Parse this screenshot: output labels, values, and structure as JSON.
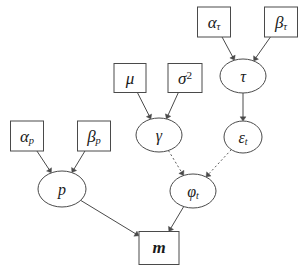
{
  "figure": {
    "type": "bayesian-network-dag",
    "background_color": "#ffffff",
    "stroke_color": "#4a4a4a",
    "text_color": "#1a1a1a",
    "width": 308,
    "height": 271,
    "top_cropped_text": "                                    "
  },
  "nodes": [
    {
      "id": "alpha_tau",
      "shape": "rect",
      "label_html": "&alpha;<sub>&tau;</sub>",
      "label_text": "alpha_tau",
      "role": "hyperparameter",
      "x": 214,
      "y": 22,
      "w": 33,
      "h": 30
    },
    {
      "id": "beta_tau",
      "shape": "rect",
      "label_html": "&beta;<sub>&tau;</sub>",
      "label_text": "beta_tau",
      "role": "hyperparameter",
      "x": 281,
      "y": 22,
      "w": 33,
      "h": 30
    },
    {
      "id": "tau",
      "shape": "ellipse",
      "label_html": "&tau;",
      "label_text": "tau",
      "role": "latent",
      "x": 243,
      "y": 76,
      "w": 46,
      "h": 34
    },
    {
      "id": "mu",
      "shape": "rect",
      "label_html": "&mu;",
      "label_text": "mu",
      "role": "hyperparameter",
      "x": 130,
      "y": 78,
      "w": 32,
      "h": 29
    },
    {
      "id": "sigma_sq",
      "shape": "rect",
      "label_html": "&sigma;<sup>2</sup>",
      "label_text": "sigma_squared",
      "role": "hyperparameter",
      "x": 185,
      "y": 78,
      "w": 34,
      "h": 29
    },
    {
      "id": "gamma",
      "shape": "ellipse",
      "label_html": "&gamma;",
      "label_text": "gamma",
      "role": "latent",
      "x": 159,
      "y": 135,
      "w": 46,
      "h": 34
    },
    {
      "id": "epsilon_t",
      "shape": "ellipse",
      "label_html": "&epsilon;<sub>t</sub>",
      "label_text": "epsilon_t",
      "role": "latent",
      "x": 243,
      "y": 137,
      "w": 38,
      "h": 32
    },
    {
      "id": "alpha_p",
      "shape": "rect",
      "label_html": "&alpha;<sub>p</sub>",
      "label_text": "alpha_p",
      "role": "hyperparameter",
      "x": 27,
      "y": 136,
      "w": 33,
      "h": 30
    },
    {
      "id": "beta_p",
      "shape": "rect",
      "label_html": "&beta;<sub>p</sub>",
      "label_text": "beta_p",
      "role": "hyperparameter",
      "x": 94,
      "y": 136,
      "w": 33,
      "h": 30
    },
    {
      "id": "p",
      "shape": "ellipse",
      "label_html": "p",
      "label_text": "p",
      "role": "latent",
      "x": 62,
      "y": 189,
      "w": 48,
      "h": 36
    },
    {
      "id": "phi_t",
      "shape": "ellipse",
      "label_html": "&phi;<sub>t</sub>",
      "label_text": "phi_t",
      "role": "latent",
      "x": 193,
      "y": 191,
      "w": 46,
      "h": 34
    },
    {
      "id": "m",
      "shape": "rect",
      "label_html": "m",
      "label_text": "m",
      "role": "observed",
      "x": 159,
      "y": 248,
      "w": 40,
      "h": 33
    }
  ],
  "edges": [
    {
      "from": "alpha_tau",
      "to": "tau",
      "style": "solid",
      "arrow": true
    },
    {
      "from": "beta_tau",
      "to": "tau",
      "style": "solid",
      "arrow": true
    },
    {
      "from": "tau",
      "to": "epsilon_t",
      "style": "solid",
      "arrow": true
    },
    {
      "from": "mu",
      "to": "gamma",
      "style": "solid",
      "arrow": true
    },
    {
      "from": "sigma_sq",
      "to": "gamma",
      "style": "solid",
      "arrow": true
    },
    {
      "from": "gamma",
      "to": "phi_t",
      "style": "dotted",
      "arrow": true
    },
    {
      "from": "epsilon_t",
      "to": "phi_t",
      "style": "dotted",
      "arrow": true
    },
    {
      "from": "alpha_p",
      "to": "p",
      "style": "solid",
      "arrow": true
    },
    {
      "from": "beta_p",
      "to": "p",
      "style": "solid",
      "arrow": true
    },
    {
      "from": "p",
      "to": "m",
      "style": "solid",
      "arrow": true
    },
    {
      "from": "phi_t",
      "to": "m",
      "style": "solid",
      "arrow": true
    }
  ]
}
